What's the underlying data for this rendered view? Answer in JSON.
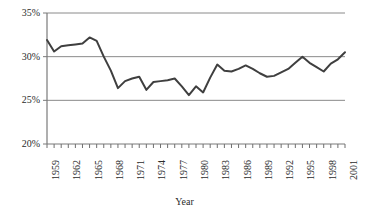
{
  "chart_data": {
    "type": "line",
    "title": "",
    "xlabel": "Year",
    "ylabel": "",
    "ylim": [
      20,
      35
    ],
    "ytick_labels": [
      "20%",
      "25%",
      "30%",
      "35%"
    ],
    "ytick_values": [
      20,
      25,
      30,
      35
    ],
    "grid": "horizontal",
    "legend": "none",
    "xlim": [
      1959,
      2001
    ],
    "xtick_labels": [
      "1959",
      "1962",
      "1965",
      "1968",
      "1971",
      "1974",
      "1977",
      "1980",
      "1983",
      "1986",
      "1989",
      "1992",
      "1995",
      "1998",
      "2001"
    ],
    "xtick_values": [
      1959,
      1962,
      1965,
      1968,
      1971,
      1974,
      1977,
      1980,
      1983,
      1986,
      1989,
      1992,
      1995,
      1998,
      2001
    ],
    "minor_ticks_every": 1,
    "series": [
      {
        "name": "share",
        "color": "#3f3f3f",
        "x": [
          1959,
          1960,
          1961,
          1962,
          1963,
          1964,
          1965,
          1966,
          1967,
          1968,
          1969,
          1970,
          1971,
          1972,
          1973,
          1974,
          1975,
          1976,
          1977,
          1978,
          1979,
          1980,
          1981,
          1982,
          1983,
          1984,
          1985,
          1986,
          1987,
          1988,
          1989,
          1990,
          1991,
          1992,
          1993,
          1994,
          1995,
          1996,
          1997,
          1998,
          1999,
          2000,
          2001
        ],
        "values": [
          31.9,
          30.6,
          31.2,
          31.3,
          31.4,
          31.5,
          32.2,
          31.8,
          30.0,
          28.4,
          26.4,
          27.2,
          27.5,
          27.7,
          26.2,
          27.1,
          27.2,
          27.3,
          27.5,
          26.6,
          25.6,
          26.6,
          25.9,
          27.6,
          29.1,
          28.4,
          28.3,
          28.6,
          29.0,
          28.6,
          28.1,
          27.7,
          27.8,
          28.2,
          28.6,
          29.3,
          30.0,
          29.3,
          28.8,
          28.3,
          29.2,
          29.7,
          30.5
        ]
      }
    ]
  },
  "axis": {
    "x_title": "Year"
  }
}
